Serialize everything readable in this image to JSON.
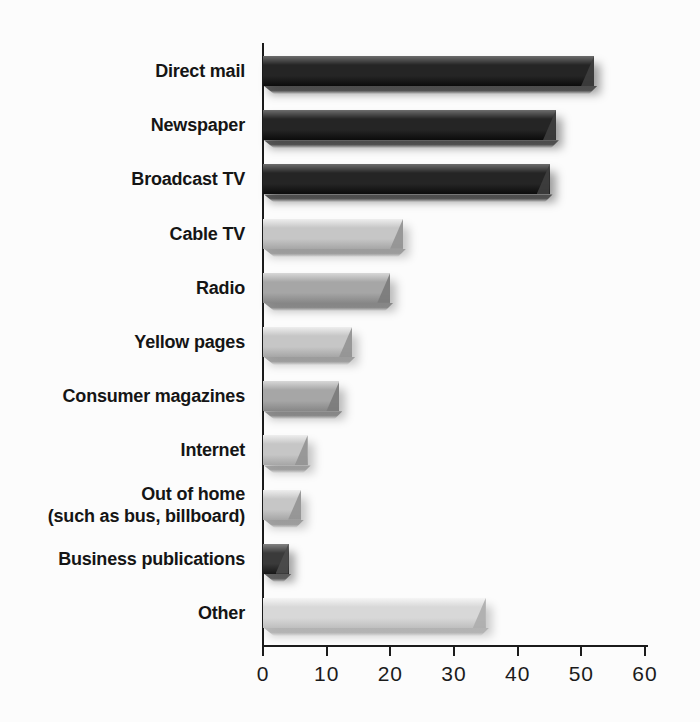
{
  "figure": {
    "background_color": "#fcfcfc",
    "axis_color": "#1b1b1b",
    "label_color": "#151515"
  },
  "chart_data": {
    "type": "bar",
    "orientation": "horizontal",
    "title": "",
    "xlabel": "",
    "ylabel": "",
    "grid": false,
    "legend": false,
    "xlim": [
      0,
      60
    ],
    "xticks": [
      "0",
      "10",
      "20",
      "30",
      "40",
      "50",
      "60"
    ],
    "xtick_values": [
      0,
      10,
      20,
      30,
      40,
      50,
      60
    ],
    "categories": [
      "Direct mail",
      "Newspaper",
      "Broadcast TV",
      "Cable TV",
      "Radio",
      "Yellow pages",
      "Consumer magazines",
      "Internet",
      "Out of home\n(such as bus, billboard)",
      "Business publications",
      "Other"
    ],
    "values": [
      52,
      46,
      45,
      22,
      20,
      14,
      12,
      7,
      6,
      4,
      35
    ],
    "bar_tones": [
      "dark",
      "dark",
      "dark",
      "light",
      "medium",
      "light",
      "medium",
      "light",
      "light",
      "darkgray",
      "lightest"
    ],
    "palette": {
      "dark": "#252525",
      "darkgray": "#3a3a3a",
      "medium": "#a6a6a6",
      "light": "#c6c6c6",
      "lightest": "#d8d8d8"
    },
    "style": "3d-beveled-bars-with-drop-shadow"
  }
}
